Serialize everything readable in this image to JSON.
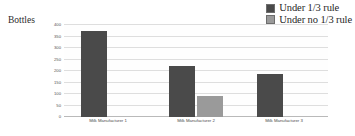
{
  "chart_data": {
    "type": "bar",
    "title": "",
    "xlabel": "",
    "ylabel": "Bottles",
    "ylim": [
      0,
      400
    ],
    "yticks": [
      0,
      50,
      100,
      150,
      200,
      250,
      300,
      350,
      400
    ],
    "ytick_labels": [
      "0",
      "50",
      "100",
      "150",
      "200",
      "250",
      "300",
      "350",
      "400"
    ],
    "grid": true,
    "legend_position": "top-right",
    "categories": [
      "Milk Manufacturer 1",
      "Milk Manufacturer 2",
      "Milk Manufacturer 3"
    ],
    "series": [
      {
        "name": "Under 1/3 rule",
        "color": "#4a4a4a",
        "values": [
          375,
          220,
          185
        ]
      },
      {
        "name": "Under no 1/3 rule",
        "color": "#9a9a9a",
        "values": [
          null,
          90,
          null
        ]
      }
    ]
  },
  "legend": {
    "entries": [
      {
        "label": "Under 1/3 rule",
        "color": "#4a4a4a"
      },
      {
        "label": "Under no 1/3 rule",
        "color": "#9a9a9a"
      }
    ]
  },
  "colors": {
    "series_dark": "#4a4a4a",
    "series_light": "#9a9a9a",
    "gridline": "#dedede",
    "baseline": "#b9b9b9",
    "plot_background": "#fefefe"
  }
}
